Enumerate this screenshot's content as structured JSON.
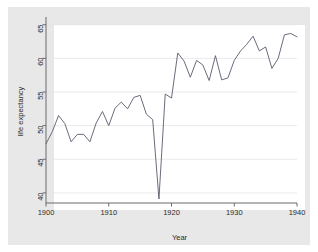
{
  "figure": {
    "background_color": "#ffffff",
    "plot_frame_color": "#e8e8e8",
    "plot_region_color": "#ffffff",
    "line_color": "#5a5a6e",
    "grid_color": "#e4e4e4",
    "axis_color": "#6b6b6b"
  },
  "chart_data": {
    "type": "line",
    "title": "",
    "subtitle": "",
    "xlabel": "Year",
    "ylabel": "life expectancy",
    "xlim": [
      1900,
      1940
    ],
    "ylim": [
      38.5,
      66.0
    ],
    "xticks": [
      1900,
      1910,
      1920,
      1930,
      1940
    ],
    "xtick_labels": [
      "1900",
      "1910",
      "1920",
      "1930",
      "1940"
    ],
    "yticks": [
      40,
      45,
      50,
      55,
      60,
      65
    ],
    "ytick_labels": [
      "40",
      "45",
      "50",
      "55",
      "60",
      "65"
    ],
    "grid": "horizontal",
    "legend": "none",
    "series": [
      {
        "name": "life expectancy",
        "x": [
          1900,
          1901,
          1902,
          1903,
          1904,
          1905,
          1906,
          1907,
          1908,
          1909,
          1910,
          1911,
          1912,
          1913,
          1914,
          1915,
          1916,
          1917,
          1918,
          1919,
          1920,
          1921,
          1922,
          1923,
          1924,
          1925,
          1926,
          1927,
          1928,
          1929,
          1930,
          1931,
          1932,
          1933,
          1934,
          1935,
          1936,
          1937,
          1938,
          1939,
          1940
        ],
        "values": [
          47.3,
          49.1,
          51.5,
          50.3,
          47.6,
          48.7,
          48.7,
          47.6,
          50.4,
          52.1,
          50.0,
          52.6,
          53.5,
          52.5,
          54.2,
          54.5,
          51.7,
          50.9,
          39.1,
          54.7,
          54.1,
          60.8,
          59.6,
          57.2,
          59.7,
          59.0,
          56.7,
          60.4,
          56.8,
          57.1,
          59.7,
          61.1,
          62.1,
          63.3,
          61.1,
          61.7,
          58.5,
          60.0,
          63.5,
          63.7,
          63.2
        ]
      }
    ]
  },
  "axis": {
    "y_title": "life expectancy",
    "x_title": "Year"
  }
}
